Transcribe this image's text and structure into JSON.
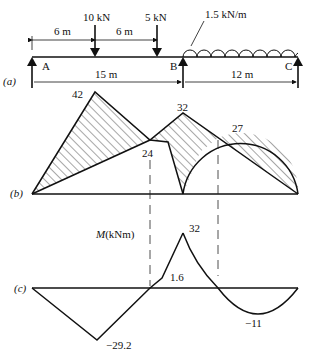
{
  "beam": {
    "part_label": "(a)",
    "support_labels": [
      "A",
      "B",
      "C"
    ],
    "loads": [
      {
        "label": "10 kN",
        "type": "point"
      },
      {
        "label": "5 kN",
        "type": "point"
      },
      {
        "label": "1.5 kN/m",
        "type": "udl"
      }
    ],
    "dimensions": [
      "6 m",
      "6 m",
      "15 m",
      "12 m"
    ]
  },
  "diagram_b": {
    "part_label": "(b)",
    "values": [
      "42",
      "32",
      "24",
      "27"
    ]
  },
  "diagram_c": {
    "part_label": "(c)",
    "axis_label": "M(kNm)",
    "values": [
      "32",
      "1.6",
      "−29.2",
      "−11"
    ]
  }
}
